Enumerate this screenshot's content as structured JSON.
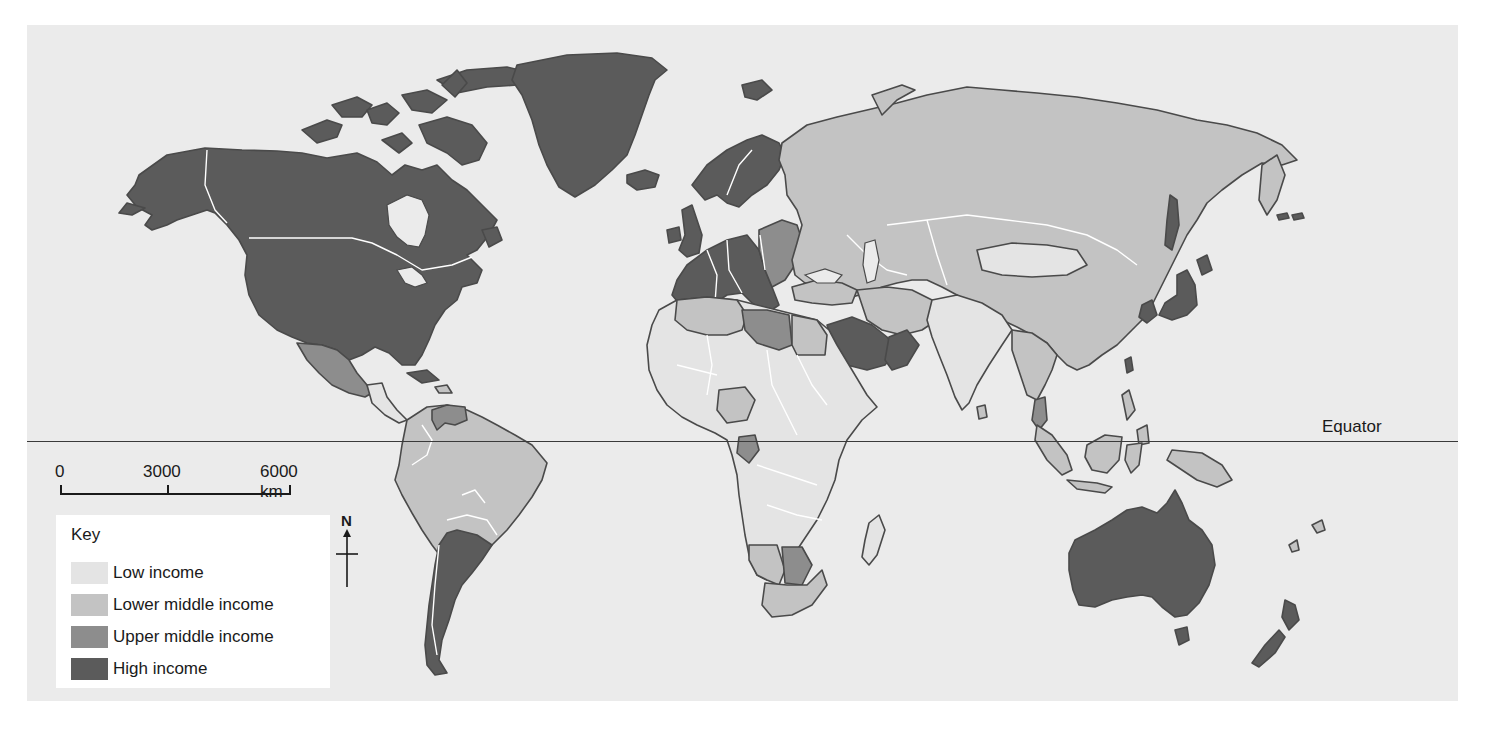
{
  "map": {
    "title": "World income classification map",
    "colors": {
      "ocean": "#ebebeb",
      "low_income": "#e4e4e4",
      "lower_middle_income": "#c3c3c3",
      "upper_middle_income": "#8d8d8d",
      "high_income": "#5b5b5b",
      "border": "#ffffff",
      "coast": "#4a4a4a"
    }
  },
  "equator": {
    "label": "Equator"
  },
  "scale": {
    "ticks": [
      "0",
      "3000",
      "6000 km"
    ]
  },
  "compass": {
    "label": "N",
    "icon": "north-arrow-icon"
  },
  "key": {
    "title": "Key",
    "items": [
      {
        "label": "Low income",
        "color": "#e4e4e4"
      },
      {
        "label": "Lower middle income",
        "color": "#c3c3c3"
      },
      {
        "label": "Upper middle income",
        "color": "#8d8d8d"
      },
      {
        "label": "High income",
        "color": "#5b5b5b"
      }
    ]
  },
  "regions": {
    "high_income": [
      "Canada",
      "United States",
      "Greenland",
      "Iceland",
      "Western Europe",
      "Scandinavia",
      "Japan",
      "South Korea",
      "Australia",
      "New Zealand",
      "Saudi Arabia",
      "Oman",
      "Argentina",
      "Chile",
      "Taiwan"
    ],
    "upper_middle_income": [
      "Mexico",
      "Venezuela",
      "Libya",
      "Eastern Europe",
      "Gabon",
      "Botswana",
      "Malaysia"
    ],
    "lower_middle_income": [
      "Russia",
      "China",
      "Brazil",
      "Colombia",
      "Peru",
      "Bolivia",
      "Egypt",
      "Algeria",
      "Iran",
      "South Africa",
      "Namibia",
      "Indonesia",
      "Philippines",
      "Thailand",
      "Turkey"
    ],
    "low_income": [
      "India",
      "Central Africa",
      "West Africa",
      "East Africa",
      "Mongolia",
      "Pakistan",
      "Madagascar"
    ]
  }
}
